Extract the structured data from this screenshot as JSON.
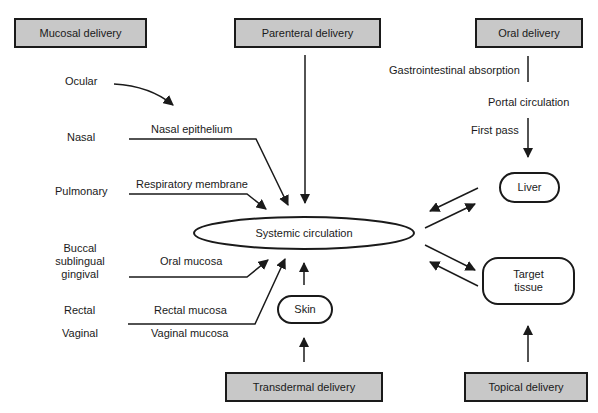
{
  "diagram": {
    "delivery_boxes": {
      "mucosal": "Mucosal delivery",
      "parenteral": "Parenteral delivery",
      "oral": "Oral delivery",
      "transdermal": "Transdermal delivery",
      "topical": "Topical delivery"
    },
    "nodes": {
      "systemic": "Systemic circulation",
      "liver": "Liver",
      "target_line1": "Target",
      "target_line2": "tissue",
      "skin": "Skin"
    },
    "mucosal_routes": {
      "ocular": "Ocular",
      "nasal": "Nasal",
      "pulmonary": "Pulmonary",
      "buccal_line1": "Buccal",
      "buccal_line2": "sublingual",
      "buccal_line3": "gingival",
      "rectal": "Rectal",
      "vaginal": "Vaginal"
    },
    "barriers": {
      "nasal_epithelium": "Nasal epithelium",
      "respiratory_membrane": "Respiratory membrane",
      "oral_mucosa": "Oral mucosa",
      "rectal_mucosa": "Rectal mucosa",
      "vaginal_mucosa": "Vaginal mucosa"
    },
    "oral_path": {
      "gi_absorption": "Gastrointestinal absorption",
      "portal_circulation": "Portal circulation",
      "first_pass": "First pass"
    },
    "colors": {
      "box_fill": "#c8c8c8",
      "stroke": "#1a1a1a",
      "background": "#ffffff"
    }
  }
}
